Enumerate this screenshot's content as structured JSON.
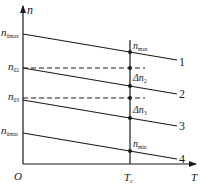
{
  "diagram": {
    "axes": {
      "y_label": "n",
      "x_label": "T",
      "origin_label": "O",
      "tc_label": "T",
      "tc_sub": "c"
    },
    "y_labels": [
      {
        "base": "n",
        "sub": "0max"
      },
      {
        "base": "n",
        "sub": "02"
      },
      {
        "base": "n",
        "sub": "03"
      },
      {
        "base": "n",
        "sub": "0min"
      }
    ],
    "tc_annotations": [
      {
        "base": "n",
        "sub": "max"
      },
      {
        "base": "Δn",
        "sub": "2"
      },
      {
        "base": "Δn",
        "sub": "3"
      },
      {
        "base": "n",
        "sub": "min"
      }
    ],
    "line_labels": [
      "1",
      "2",
      "3",
      "4"
    ],
    "colors": {
      "line": "#1a1a1a",
      "background": "#ffffff"
    }
  }
}
